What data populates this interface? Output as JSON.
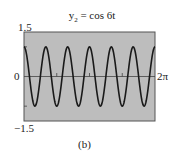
{
  "chart_data": {
    "type": "line",
    "title": "y2 = cos 6t",
    "title_parts": {
      "var": "y",
      "sub": "2",
      "rest": " = cos 6t"
    },
    "xlabel": "",
    "ylabel": "",
    "xlim": [
      0,
      6.2832
    ],
    "ylim": [
      -1.5,
      1.5
    ],
    "y_tick_labels": [
      "1.5",
      "0",
      "−1.5"
    ],
    "x_tick_labels": [
      "2π"
    ],
    "function": "cos(6t)",
    "series": [
      {
        "name": "y2 = cos 6t",
        "expression": "cos(6t)",
        "amplitude": 1,
        "angular_frequency": 6,
        "periods_shown": 6
      }
    ],
    "background_color": "#bdbdbd",
    "line_color": "#1a1a1a",
    "grid": false,
    "caption": "(b)"
  }
}
